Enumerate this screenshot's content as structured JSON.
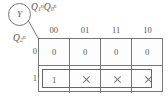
{
  "figure": {
    "type": "karnaugh-map",
    "output_variable": "Y",
    "column_variable": {
      "base": "Q",
      "sub": "1",
      "sup": "n",
      "base2": "Q",
      "sub2": "0",
      "sup2": "n"
    },
    "row_variable": {
      "base": "Q",
      "sub": "2",
      "sup": "n"
    },
    "column_headers": [
      "00",
      "01",
      "11",
      "10"
    ],
    "row_headers": [
      "0",
      "1"
    ],
    "cells": [
      [
        "0",
        "0",
        "0",
        "0"
      ],
      [
        "1",
        "×",
        "×",
        "×"
      ]
    ],
    "grouping": {
      "label": "group-row-1",
      "row": 1,
      "columns": [
        "00",
        "01",
        "11",
        "10"
      ]
    },
    "colors": {
      "line": "#777777",
      "text": "#555555",
      "group": "#666666",
      "background": "#ffffff"
    }
  }
}
